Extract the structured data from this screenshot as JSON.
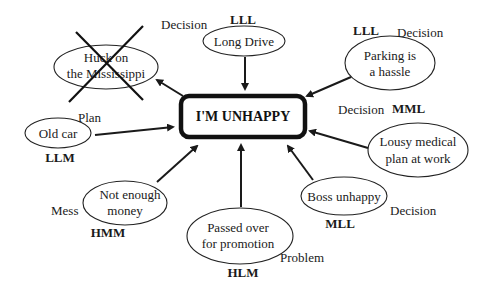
{
  "center": {
    "label": "I'M UNHAPPY"
  },
  "nodes": [
    {
      "id": "huck",
      "lines": [
        "Huck on",
        "the Mississippi"
      ],
      "category": "Decision",
      "code": "",
      "crossed_out": true
    },
    {
      "id": "long-drive",
      "lines": [
        "Long Drive"
      ],
      "category": "",
      "code": "LLL",
      "crossed_out": false
    },
    {
      "id": "parking",
      "lines": [
        "Parking is",
        "a hassle"
      ],
      "category": "Decision",
      "code": "LLL",
      "crossed_out": false
    },
    {
      "id": "old-car",
      "lines": [
        "Old car"
      ],
      "category": "Plan",
      "code": "LLM",
      "crossed_out": false
    },
    {
      "id": "medical",
      "lines": [
        "Lousy medical",
        "plan at work"
      ],
      "category": "Decision",
      "code": "MML",
      "crossed_out": false
    },
    {
      "id": "money",
      "lines": [
        "Not enough",
        "money"
      ],
      "category": "Mess",
      "code": "HMM",
      "crossed_out": false
    },
    {
      "id": "promotion",
      "lines": [
        "Passed over",
        "for promotion"
      ],
      "category": "Problem",
      "code": "HLM",
      "crossed_out": false
    },
    {
      "id": "boss",
      "lines": [
        "Boss unhappy"
      ],
      "category": "Decision",
      "code": "MLL",
      "crossed_out": false
    }
  ],
  "colors": {
    "line": "#1a1a1a",
    "background": "#ffffff"
  }
}
